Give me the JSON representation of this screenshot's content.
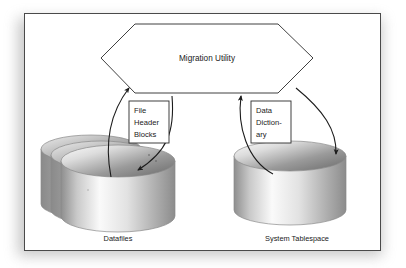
{
  "figure": {
    "background_color": "#ffffff",
    "frame_border_color": "#4a4a4a",
    "shadow_color": "#9a9a9a"
  },
  "process_node": {
    "shape": "hexagon",
    "label": "Migration Utility",
    "stroke_color": "#2b2b2b",
    "fill_color": "#ffffff"
  },
  "annotations": [
    {
      "id": "file-header-blocks",
      "lines": [
        "File",
        "Header",
        "Blocks"
      ],
      "stroke_color": "#2b2b2b"
    },
    {
      "id": "data-dictionary",
      "lines": [
        "Data",
        "Diction-",
        "ary"
      ],
      "stroke_color": "#2b2b2b"
    }
  ],
  "stores": [
    {
      "id": "datafiles",
      "caption": "Datafiles",
      "shape": "cylinder-stack",
      "count": 3,
      "top_fill_light": "#f4f4f4",
      "top_fill_dark": "#6f6f6f",
      "body_fill_light": "#fbfbfb",
      "body_fill_dark": "#7b7b7b",
      "stroke_color": "#8a8a8a"
    },
    {
      "id": "system-tablespace",
      "caption": "System Tablespace",
      "shape": "cylinder",
      "count": 1,
      "top_fill_light": "#f4f4f4",
      "top_fill_dark": "#6f6f6f",
      "body_fill_light": "#fbfbfb",
      "body_fill_dark": "#7b7b7b",
      "stroke_color": "#8a8a8a"
    }
  ],
  "flows": [
    {
      "id": "datafiles-to-utility",
      "from": "datafiles",
      "to": "process_node",
      "labelled_by": "file-header-blocks",
      "direction": "up",
      "stroke_color": "#1c1c1c"
    },
    {
      "id": "utility-to-datafiles",
      "from": "process_node",
      "to": "datafiles",
      "labelled_by": "file-header-blocks",
      "direction": "down",
      "stroke_color": "#1c1c1c"
    },
    {
      "id": "tablespace-to-utility",
      "from": "system-tablespace",
      "to": "process_node",
      "labelled_by": "data-dictionary",
      "direction": "up",
      "stroke_color": "#1c1c1c"
    },
    {
      "id": "utility-to-tablespace",
      "from": "process_node",
      "to": "system-tablespace",
      "labelled_by": "data-dictionary",
      "direction": "down",
      "stroke_color": "#1c1c1c"
    }
  ]
}
